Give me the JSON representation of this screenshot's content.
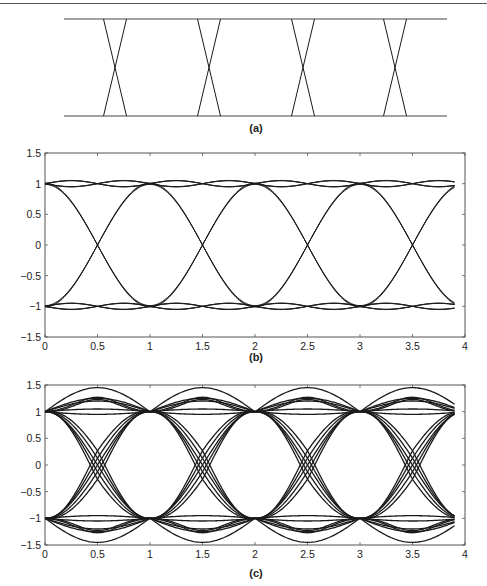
{
  "figure": {
    "panels": [
      {
        "id": "a",
        "caption": "(a)"
      },
      {
        "id": "b",
        "caption": "(b)"
      },
      {
        "id": "c",
        "caption": "(c)"
      }
    ]
  },
  "chart_data": [
    {
      "type": "line",
      "title": "(a) Ideal eye pattern (schematic)",
      "description": "Two horizontal rails with trapezoidal transitions crossing at 4 symbol boundaries",
      "levels": [
        1,
        -1
      ],
      "crossings_x_px": [
        115,
        209,
        303,
        395
      ],
      "axes": false
    },
    {
      "type": "line",
      "title": "(b)",
      "xlabel": "",
      "ylabel": "",
      "xlim": [
        0,
        4
      ],
      "ylim": [
        -1.5,
        1.5
      ],
      "xticks": [
        0,
        0.5,
        1,
        1.5,
        2,
        2.5,
        3,
        3.5,
        4
      ],
      "yticks": [
        -1.5,
        -1,
        -0.5,
        0,
        0.5,
        1,
        1.5
      ],
      "xtick_labels": [
        "0",
        "0.5",
        "1",
        "1.5",
        "2",
        "2.5",
        "3",
        "3.5",
        "4"
      ],
      "ytick_labels": [
        "-1.5",
        "-1",
        "-0.5",
        "0",
        "0.5",
        "1",
        "1.5"
      ],
      "description": "Eye diagram, open eye, levels ±1, transitions crossing zero at 0.5, 1.5, 2.5, 3.5; small ripple ±0.05 around levels",
      "levels": [
        1,
        -1
      ],
      "crossing_x": [
        0.5,
        1.5,
        2.5,
        3.5
      ],
      "ripple": 0.05,
      "x_end": 3.9
    },
    {
      "type": "line",
      "title": "(c)",
      "xlabel": "",
      "ylabel": "",
      "xlim": [
        0,
        4
      ],
      "ylim": [
        -1.5,
        1.5
      ],
      "xticks": [
        0,
        0.5,
        1,
        1.5,
        2,
        2.5,
        3,
        3.5,
        4
      ],
      "yticks": [
        -1.5,
        -1,
        -0.5,
        0,
        0.5,
        1,
        1.5
      ],
      "xtick_labels": [
        "0",
        "0.5",
        "1",
        "1.5",
        "2",
        "2.5",
        "3",
        "3.5",
        "4"
      ],
      "ytick_labels": [
        "-1.5",
        "-1",
        "-0.5",
        "0",
        "0.5",
        "1",
        "1.5"
      ],
      "description": "Eye diagram with ISI: multiple traces, overshoot up to ±1.45, zero crossings spread around 0.5, 1.5, 2.5, 3.5",
      "levels": [
        1,
        -1
      ],
      "crossing_x": [
        0.5,
        1.5,
        2.5,
        3.5
      ],
      "overshoots": [
        0.95,
        1.05,
        1.2,
        1.25,
        1.45
      ],
      "crossing_spread": 0.08,
      "x_end": 3.9
    }
  ],
  "colors": {
    "trace": "#1a1a1a",
    "axis": "#555555",
    "text": "#222222"
  }
}
